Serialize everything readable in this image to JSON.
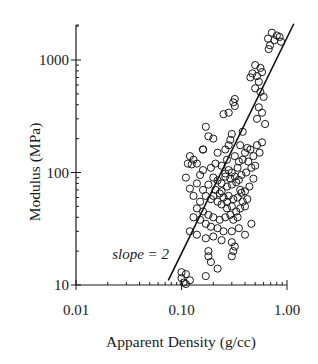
{
  "chart_data": {
    "type": "scatter",
    "title": "",
    "xlabel": "Apparent Density (g/cc)",
    "ylabel": "Modulus (MPa)",
    "xscale": "log",
    "yscale": "log",
    "xlim": [
      0.01,
      1.0
    ],
    "ylim": [
      10,
      2000
    ],
    "x_ticks": [
      {
        "value": 0.01,
        "label": "0.01"
      },
      {
        "value": 0.1,
        "label": "0.10"
      },
      {
        "value": 1.0,
        "label": "1.00"
      }
    ],
    "y_ticks": [
      {
        "value": 10,
        "label": "10"
      },
      {
        "value": 100,
        "label": "100"
      },
      {
        "value": 1000,
        "label": "1000"
      }
    ],
    "grid": false,
    "legend": null,
    "annotations": [
      {
        "text": "slope = 2",
        "x": 0.022,
        "y": 17
      }
    ],
    "fit_line": {
      "label": "slope = 2",
      "x": [
        0.075,
        1.16
      ],
      "y": [
        11,
        2100
      ]
    },
    "series": [
      {
        "name": "specimens",
        "marker": "open-circle",
        "points": [
          [
            0.72,
            1750
          ],
          [
            0.8,
            1650
          ],
          [
            0.66,
            1550
          ],
          [
            0.85,
            1600
          ],
          [
            0.76,
            1500
          ],
          [
            0.69,
            1350
          ],
          [
            0.88,
            1450
          ],
          [
            0.67,
            1250
          ],
          [
            0.5,
            900
          ],
          [
            0.56,
            850
          ],
          [
            0.47,
            760
          ],
          [
            0.52,
            720
          ],
          [
            0.58,
            780
          ],
          [
            0.45,
            700
          ],
          [
            0.54,
            640
          ],
          [
            0.5,
            560
          ],
          [
            0.56,
            520
          ],
          [
            0.6,
            470
          ],
          [
            0.54,
            380
          ],
          [
            0.58,
            340
          ],
          [
            0.52,
            300
          ],
          [
            0.62,
            270
          ],
          [
            0.32,
            450
          ],
          [
            0.31,
            420
          ],
          [
            0.32,
            390
          ],
          [
            0.28,
            340
          ],
          [
            0.25,
            330
          ],
          [
            0.38,
            230
          ],
          [
            0.3,
            220
          ],
          [
            0.17,
            255
          ],
          [
            0.29,
            195
          ],
          [
            0.28,
            175
          ],
          [
            0.26,
            160
          ],
          [
            0.22,
            150
          ],
          [
            0.16,
            160
          ],
          [
            0.16,
            160
          ],
          [
            0.12,
            140
          ],
          [
            0.13,
            130
          ],
          [
            0.115,
            120
          ],
          [
            0.125,
            118
          ],
          [
            0.14,
            120
          ],
          [
            0.18,
            210
          ],
          [
            0.2,
            200
          ],
          [
            0.36,
            175
          ],
          [
            0.42,
            165
          ],
          [
            0.4,
            150
          ],
          [
            0.45,
            160
          ],
          [
            0.48,
            140
          ],
          [
            0.38,
            130
          ],
          [
            0.43,
            125
          ],
          [
            0.46,
            110
          ],
          [
            0.5,
            115
          ],
          [
            0.55,
            150
          ],
          [
            0.32,
            140
          ],
          [
            0.35,
            125
          ],
          [
            0.34,
            110
          ],
          [
            0.3,
            100
          ],
          [
            0.37,
            95
          ],
          [
            0.28,
            105
          ],
          [
            0.41,
            100
          ],
          [
            0.52,
            175
          ],
          [
            0.58,
            185
          ],
          [
            0.26,
            92
          ],
          [
            0.22,
            85
          ],
          [
            0.24,
            80
          ],
          [
            0.27,
            75
          ],
          [
            0.3,
            78
          ],
          [
            0.33,
            82
          ],
          [
            0.36,
            70
          ],
          [
            0.4,
            68
          ],
          [
            0.44,
            75
          ],
          [
            0.48,
            88
          ],
          [
            0.2,
            90
          ],
          [
            0.18,
            78
          ],
          [
            0.21,
            70
          ],
          [
            0.23,
            65
          ],
          [
            0.25,
            60
          ],
          [
            0.28,
            62
          ],
          [
            0.31,
            58
          ],
          [
            0.34,
            60
          ],
          [
            0.38,
            55
          ],
          [
            0.42,
            58
          ],
          [
            0.16,
            70
          ],
          [
            0.17,
            62
          ],
          [
            0.19,
            58
          ],
          [
            0.22,
            55
          ],
          [
            0.24,
            52
          ],
          [
            0.27,
            48
          ],
          [
            0.3,
            50
          ],
          [
            0.33,
            45
          ],
          [
            0.36,
            48
          ],
          [
            0.4,
            50
          ],
          [
            0.15,
            55
          ],
          [
            0.14,
            48
          ],
          [
            0.16,
            45
          ],
          [
            0.18,
            42
          ],
          [
            0.2,
            40
          ],
          [
            0.23,
            38
          ],
          [
            0.26,
            40
          ],
          [
            0.29,
            42
          ],
          [
            0.31,
            38
          ],
          [
            0.34,
            40
          ],
          [
            0.13,
            40
          ],
          [
            0.15,
            38
          ],
          [
            0.17,
            35
          ],
          [
            0.19,
            33
          ],
          [
            0.22,
            32
          ],
          [
            0.25,
            30
          ],
          [
            0.3,
            30
          ],
          [
            0.35,
            32
          ],
          [
            0.4,
            28
          ],
          [
            0.46,
            35
          ],
          [
            0.12,
            30
          ],
          [
            0.14,
            28
          ],
          [
            0.17,
            26
          ],
          [
            0.2,
            27
          ],
          [
            0.24,
            25
          ],
          [
            0.3,
            24
          ],
          [
            0.32,
            22
          ],
          [
            0.31,
            20
          ],
          [
            0.3,
            18
          ],
          [
            0.18,
            20
          ],
          [
            0.18,
            18
          ],
          [
            0.19,
            16
          ],
          [
            0.22,
            14
          ],
          [
            0.17,
            12
          ],
          [
            0.1,
            13
          ],
          [
            0.11,
            12.5
          ],
          [
            0.1,
            11.5
          ],
          [
            0.105,
            10.5
          ],
          [
            0.11,
            10.2
          ],
          [
            0.12,
            11
          ],
          [
            0.13,
            62
          ],
          [
            0.12,
            72
          ],
          [
            0.14,
            80
          ],
          [
            0.11,
            90
          ],
          [
            0.15,
            95
          ],
          [
            0.16,
            105
          ],
          [
            0.19,
            110
          ],
          [
            0.21,
            120
          ],
          [
            0.27,
            130
          ],
          [
            0.24,
            115
          ],
          [
            0.26,
            98
          ],
          [
            0.29,
            88
          ],
          [
            0.32,
            92
          ],
          [
            0.35,
            86
          ],
          [
            0.24,
            68
          ],
          [
            0.2,
            62
          ],
          [
            0.27,
            55
          ],
          [
            0.37,
            66
          ]
        ]
      }
    ]
  }
}
